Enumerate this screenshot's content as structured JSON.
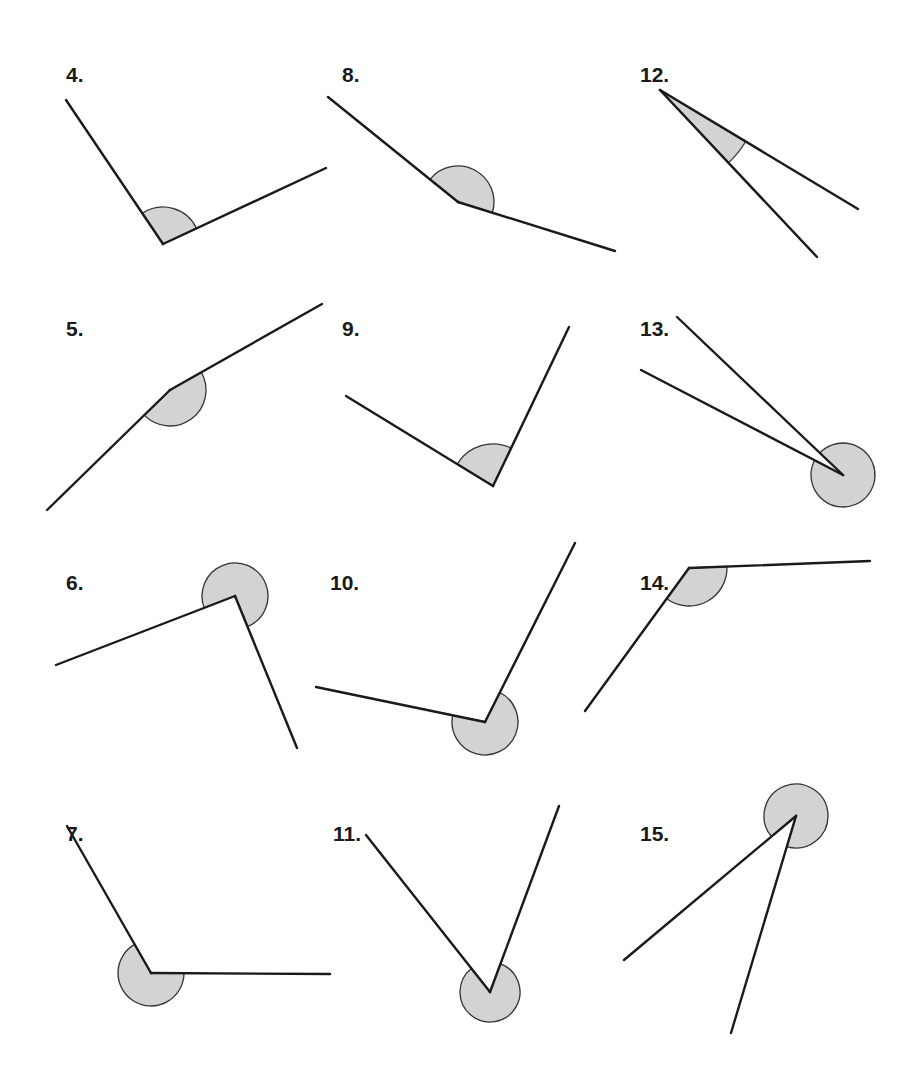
{
  "figure": {
    "shade_color": "#d3d3d3",
    "line_color": "#1a1a1a",
    "problems": [
      {
        "label": "4.",
        "marked_angle": "interior",
        "approx_degrees": 99
      },
      {
        "label": "5.",
        "marked_angle": "interior",
        "approx_degrees": 174
      },
      {
        "label": "6.",
        "marked_angle": "reflex",
        "approx_degrees": 268
      },
      {
        "label": "7.",
        "marked_angle": "reflex",
        "approx_degrees": 240
      },
      {
        "label": "8.",
        "marked_angle": "interior",
        "approx_degrees": 161
      },
      {
        "label": "9.",
        "marked_angle": "interior",
        "approx_degrees": 85
      },
      {
        "label": "10.",
        "marked_angle": "reflex",
        "approx_degrees": 248
      },
      {
        "label": "11.",
        "marked_angle": "reflex",
        "approx_degrees": 300
      },
      {
        "label": "12.",
        "marked_angle": "interior",
        "approx_degrees": 17
      },
      {
        "label": "13.",
        "marked_angle": "reflex",
        "approx_degrees": 344
      },
      {
        "label": "14.",
        "marked_angle": "interior",
        "approx_degrees": 146
      },
      {
        "label": "15.",
        "marked_angle": "reflex",
        "approx_degrees": 322
      }
    ]
  }
}
